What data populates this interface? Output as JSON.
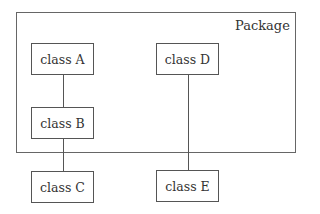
{
  "diagram": {
    "type": "uml-package-diagram",
    "package": {
      "label": "Package",
      "contains": [
        "class A",
        "class B",
        "class D"
      ]
    },
    "classes": [
      {
        "id": "A",
        "label": "class A",
        "inside_package": true
      },
      {
        "id": "B",
        "label": "class B",
        "inside_package": true
      },
      {
        "id": "C",
        "label": "class C",
        "inside_package": false
      },
      {
        "id": "D",
        "label": "class D",
        "inside_package": true
      },
      {
        "id": "E",
        "label": "class E",
        "inside_package": false
      }
    ],
    "connections": [
      {
        "from": "A",
        "to": "B"
      },
      {
        "from": "B",
        "to": "C"
      },
      {
        "from": "D",
        "to": "E"
      }
    ]
  }
}
